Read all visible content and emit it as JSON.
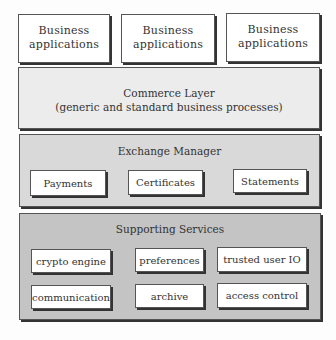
{
  "business_apps": [
    {
      "line1": "Business",
      "line2": "applications"
    },
    {
      "line1": "Business",
      "line2": "applications"
    },
    {
      "line1": "Business",
      "line2": "applications"
    }
  ],
  "commerce_layer": {
    "title": "Commerce Layer",
    "subtitle": "(generic and standard business processes)",
    "color": "#ececec"
  },
  "exchange_manager": {
    "title": "Exchange Manager",
    "color": "#d9d9d9",
    "items": [
      "Payments",
      "Certificates",
      "Statements"
    ]
  },
  "supporting_services": {
    "title": "Supporting Services",
    "color": "#c4c4c4",
    "items": [
      "crypto engine",
      "preferences",
      "trusted user IO",
      "communication",
      "archive",
      "access control"
    ]
  }
}
